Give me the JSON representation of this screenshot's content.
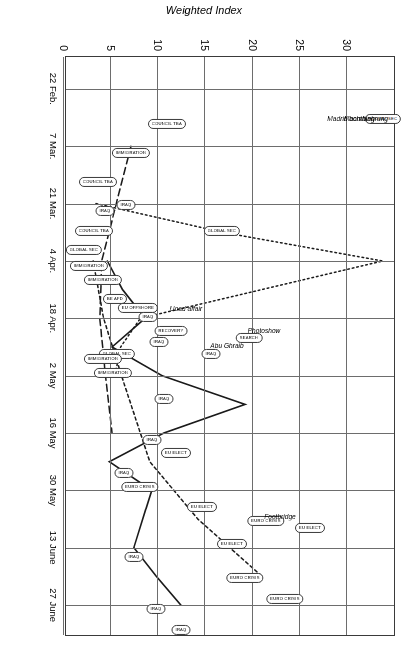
{
  "chart_data": {
    "type": "line",
    "title": "",
    "xlabel": "",
    "ylabel": "Weighted Index",
    "ylim": [
      0,
      35
    ],
    "yticks": [
      0,
      5,
      10,
      15,
      20,
      25,
      30,
      35
    ],
    "xtick_labels": [
      "22 Feb.",
      "7 Mar.",
      "21 Mar.",
      "4 Apr.",
      "18 Apr.",
      "2 May",
      "16 May",
      "30 May",
      "13 June",
      "27 June"
    ],
    "grid": true,
    "legend_position": "none",
    "series": [
      {
        "name": "IRAQ",
        "style": "solid",
        "points": [
          {
            "x": "4 Apr.",
            "y": 4.6,
            "label": "IRAQ"
          },
          {
            "x": "11 Apr.",
            "y": 6.2,
            "label": "IRAQ"
          },
          {
            "x": "18 Apr.",
            "y": 8.6,
            "label": "IRAQ"
          },
          {
            "x": "25 Apr.",
            "y": 5.1,
            "label": "IRAQ"
          },
          {
            "x": "2 May",
            "y": 10.4,
            "label": "IRAQ"
          },
          {
            "x": "9 May",
            "y": 19.2,
            "label": "IRAQ"
          },
          {
            "x": "16 May",
            "y": 10.6,
            "label": "IRAQ"
          },
          {
            "x": "23 May",
            "y": 4.8,
            "label": "IRAQ"
          },
          {
            "x": "30 May",
            "y": 9.3,
            "label": "IRAQ"
          },
          {
            "x": "13 June",
            "y": 7.4,
            "label": "IRAQ"
          },
          {
            "x": "20 June",
            "y": 9.8,
            "label": "IRAQ"
          },
          {
            "x": "27 June",
            "y": 12.4,
            "label": "IRAQ"
          }
        ]
      },
      {
        "name": "EU ELECT",
        "style": "dashed-fine",
        "points": [
          {
            "x": "4 Apr.",
            "y": 3.1,
            "label": "EU ELECT"
          },
          {
            "x": "18 Apr.",
            "y": 4.2,
            "label": "EU ELECT"
          },
          {
            "x": "2 May",
            "y": 6.1,
            "label": "EU ELECT"
          },
          {
            "x": "23 May",
            "y": 9.1,
            "label": "EU ELECT"
          },
          {
            "x": "6 June",
            "y": 14.2,
            "label": "EU ELECT"
          },
          {
            "x": "13 June",
            "y": 17.6,
            "label": "EU ELECT"
          },
          {
            "x": "20 June",
            "y": 21.0,
            "label": "EU ELECT"
          }
        ]
      },
      {
        "name": "GLOBAL SEC",
        "style": "dotted",
        "points": [
          {
            "x": "21 Mar.",
            "y": 3.4,
            "label": "GLOBAL SEC"
          },
          {
            "x": "28 Mar.",
            "y": 16.8,
            "label": "GLOBAL SEC"
          },
          {
            "x": "4 Apr.",
            "y": 33.8,
            "label": "GLOBAL SEC"
          },
          {
            "x": "18 Apr.",
            "y": 8.1,
            "label": "GLOBAL SEC"
          },
          {
            "x": "25 Apr.",
            "y": 6.0,
            "label": "GLOBAL SEC"
          },
          {
            "x": "2 May",
            "y": 5.4,
            "label": "GLOBAL SEC"
          }
        ]
      },
      {
        "name": "IMMIGRATION",
        "style": "dashed",
        "points": [
          {
            "x": "7 Mar.",
            "y": 7.1,
            "label": "IMMIGRATION"
          },
          {
            "x": "4 Apr.",
            "y": 4.0,
            "label": "IMMIGRATION"
          },
          {
            "x": "18 Apr.",
            "y": 3.8,
            "label": "IMMIGRATION"
          },
          {
            "x": "2 May",
            "y": 4.4,
            "label": "IMMIGRATION"
          },
          {
            "x": "16 May",
            "y": 5.1,
            "label": "IMMIGRATION"
          }
        ]
      }
    ],
    "point_labels": [
      {
        "text": "COUNCIL TBA",
        "x": 0.115,
        "y": 10.9
      },
      {
        "text": "IMMIGRATION",
        "x": 0.165,
        "y": 7.1
      },
      {
        "text": "COUNCIL TBA",
        "x": 0.215,
        "y": 3.6
      },
      {
        "text": "GLOBAL SEC",
        "x": 0.107,
        "y": 33.8
      },
      {
        "text": "GLOBAL SEC",
        "x": 0.3,
        "y": 16.8
      },
      {
        "text": "IRAQ",
        "x": 0.255,
        "y": 6.6
      },
      {
        "text": "IRAQ",
        "x": 0.265,
        "y": 4.4
      },
      {
        "text": "COUNCIL TBA",
        "x": 0.3,
        "y": 3.2
      },
      {
        "text": "GLOBAL SEC",
        "x": 0.332,
        "y": 2.1
      },
      {
        "text": "IMMIGRATION",
        "x": 0.36,
        "y": 2.6
      },
      {
        "text": "IMMIGRATION",
        "x": 0.385,
        "y": 4.1
      },
      {
        "text": "BE AFD",
        "x": 0.418,
        "y": 5.4
      },
      {
        "text": "EU OFFSHORE",
        "x": 0.432,
        "y": 7.8
      },
      {
        "text": "IRAQ",
        "x": 0.448,
        "y": 8.9
      },
      {
        "text": "RECOVERY",
        "x": 0.472,
        "y": 11.4
      },
      {
        "text": "IRAQ",
        "x": 0.492,
        "y": 10.1
      },
      {
        "text": "GLOBAL SEC",
        "x": 0.512,
        "y": 5.6
      },
      {
        "text": "IMMIGRATION",
        "x": 0.52,
        "y": 4.1
      },
      {
        "text": "IMMIGRATION",
        "x": 0.545,
        "y": 5.2
      },
      {
        "text": "IRAQ",
        "x": 0.512,
        "y": 15.6
      },
      {
        "text": "SEARCH",
        "x": 0.485,
        "y": 19.6
      },
      {
        "text": "IRAQ",
        "x": 0.59,
        "y": 10.6
      },
      {
        "text": "IRAQ",
        "x": 0.66,
        "y": 9.3
      },
      {
        "text": "EU ELECT",
        "x": 0.682,
        "y": 11.9
      },
      {
        "text": "IRAQ",
        "x": 0.718,
        "y": 6.4
      },
      {
        "text": "EURO CRISIS",
        "x": 0.742,
        "y": 8.1
      },
      {
        "text": "EU ELECT",
        "x": 0.775,
        "y": 14.6
      },
      {
        "text": "EURO CRISIS",
        "x": 0.8,
        "y": 21.4
      },
      {
        "text": "EU ELECT",
        "x": 0.812,
        "y": 26.1
      },
      {
        "text": "EU ELECT",
        "x": 0.84,
        "y": 17.8
      },
      {
        "text": "IRAQ",
        "x": 0.862,
        "y": 7.4
      },
      {
        "text": "EURO CRISIS",
        "x": 0.898,
        "y": 19.2
      },
      {
        "text": "EURO CRISIS",
        "x": 0.935,
        "y": 23.4
      },
      {
        "text": "IRAQ",
        "x": 0.952,
        "y": 9.8
      },
      {
        "text": "IRAQ",
        "x": 0.988,
        "y": 12.4
      }
    ],
    "annotations": [
      {
        "text": "Machtfuehrung",
        "x": 0.105,
        "y": 32.0
      },
      {
        "text": "Madrid bombing",
        "x": 0.105,
        "y": 30.4
      },
      {
        "text": "Photoshow",
        "x": 0.47,
        "y": 21.2
      },
      {
        "text": "Abu Ghraib",
        "x": 0.497,
        "y": 17.3
      },
      {
        "text": "Uoad affair",
        "x": 0.432,
        "y": 12.9
      },
      {
        "text": "Footbridge",
        "x": 0.792,
        "y": 22.9
      }
    ]
  }
}
